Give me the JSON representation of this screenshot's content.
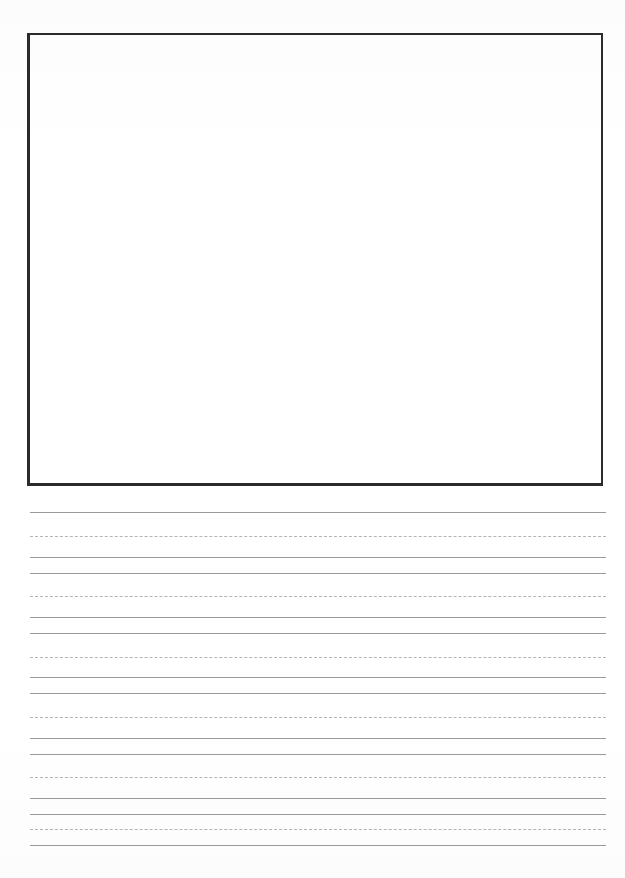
{
  "page": {
    "kind": "handwriting-practice-worksheet",
    "width": 625,
    "height": 878,
    "background_color": "#ffffff",
    "title": "",
    "visible_text": ""
  },
  "draw_box": {
    "label": "",
    "caption": "",
    "border_color": "#2b2b2b",
    "fill_color": "#ffffff",
    "x": 27,
    "y": 33,
    "width": 576,
    "height": 453
  },
  "rules": {
    "solid_color": "#9a9a9a",
    "dashed_color": "#b4b4b4",
    "left_x": 30,
    "right_x": 606,
    "width": 576,
    "groups": 6,
    "group_height": 60,
    "lines": [
      {
        "y": 512,
        "style": "solid"
      },
      {
        "y": 536,
        "style": "dashed"
      },
      {
        "y": 557,
        "style": "solid"
      },
      {
        "y": 573,
        "style": "solid"
      },
      {
        "y": 596,
        "style": "dashed"
      },
      {
        "y": 617,
        "style": "solid"
      },
      {
        "y": 633,
        "style": "solid"
      },
      {
        "y": 657,
        "style": "dashed"
      },
      {
        "y": 677,
        "style": "solid"
      },
      {
        "y": 693,
        "style": "solid"
      },
      {
        "y": 717,
        "style": "dashed"
      },
      {
        "y": 738,
        "style": "solid"
      },
      {
        "y": 754,
        "style": "solid"
      },
      {
        "y": 777,
        "style": "dashed"
      },
      {
        "y": 798,
        "style": "solid"
      },
      {
        "y": 814,
        "style": "solid"
      },
      {
        "y": 829,
        "style": "dashed"
      },
      {
        "y": 845,
        "style": "solid"
      }
    ]
  }
}
